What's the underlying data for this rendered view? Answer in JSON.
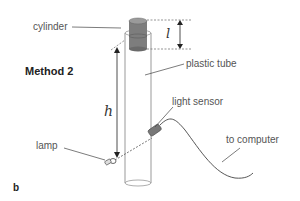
{
  "diagram": {
    "title": "Method 2",
    "figure_label": "b",
    "labels": {
      "cylinder": "cylinder",
      "plastic_tube": "plastic tube",
      "light_sensor": "light sensor",
      "lamp": "lamp",
      "to_computer": "to computer"
    },
    "variables": {
      "length": "l",
      "height": "h"
    },
    "colors": {
      "cylinder_fill": "#7a7a7a",
      "line": "#333333",
      "tube_outline": "#888888",
      "text": "#555555"
    }
  }
}
